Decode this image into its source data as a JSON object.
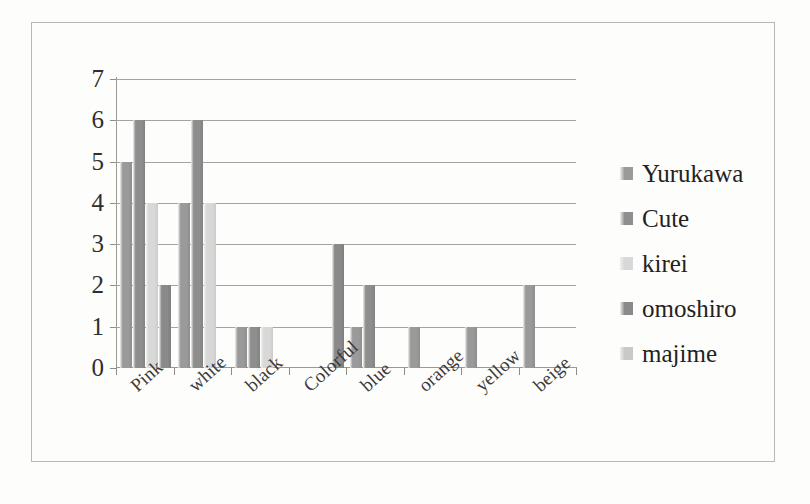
{
  "chart_data": {
    "type": "bar",
    "title": "",
    "subtitle": "",
    "xlabel": "",
    "ylabel": "",
    "ylim": [
      0,
      7
    ],
    "yticks": [
      0,
      1,
      2,
      3,
      4,
      5,
      6,
      7
    ],
    "grid": true,
    "legend_position": "right",
    "orientation": "vertical",
    "grouping": "clustered",
    "categories": [
      "Pink",
      "white",
      "black",
      "Colorful",
      "blue",
      "orange",
      "yellow",
      "beige"
    ],
    "series": [
      {
        "name": "Yurukawa",
        "color": "#9a9a9a",
        "values": [
          5,
          4,
          1,
          0,
          1,
          1,
          1,
          2
        ]
      },
      {
        "name": "Cute",
        "color": "#8e8e8e",
        "values": [
          6,
          6,
          1,
          0,
          2,
          0,
          0,
          0
        ]
      },
      {
        "name": "kirei",
        "color": "#d8d8d8",
        "values": [
          4,
          4,
          1,
          0,
          0,
          0,
          0,
          0
        ]
      },
      {
        "name": "omoshiro",
        "color": "#8a8a8a",
        "values": [
          2,
          0,
          0,
          3,
          0,
          0,
          0,
          0
        ]
      },
      {
        "name": "majime",
        "color": "#c9c9c9",
        "values": [
          0,
          0,
          0,
          0,
          0,
          0,
          0,
          0
        ]
      }
    ]
  },
  "legend": {
    "items": [
      {
        "label": "Yurukawa",
        "color": "#9a9a9a"
      },
      {
        "label": "Cute",
        "color": "#8e8e8e"
      },
      {
        "label": "kirei",
        "color": "#d8d8d8"
      },
      {
        "label": "omoshiro",
        "color": "#8a8a8a"
      },
      {
        "label": "majime",
        "color": "#c9c9c9"
      }
    ]
  },
  "style": {
    "page_background": "#fdfdfb",
    "frame_border": "#b9b9b4",
    "gridline_color": "#a5a5a0",
    "axis_color": "#9a9a95",
    "text_color": "#2e2e2e"
  }
}
